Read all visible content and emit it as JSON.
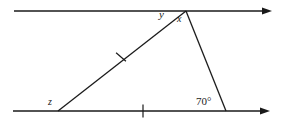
{
  "figure": {
    "type": "geometry-diagram",
    "background_color": "#ffffff",
    "stroke_color": "#1a1a1a",
    "canvas": {
      "width": 283,
      "height": 127
    }
  },
  "labels": {
    "angle_y": "y",
    "angle_x": "x",
    "angle_z": "z",
    "angle_known": "70°"
  },
  "geometry": {
    "parallel_line_top": {
      "x1": 14,
      "y1": 11,
      "x2": 272,
      "y2": 11,
      "arrow": "right"
    },
    "parallel_line_bottom": {
      "x1": 13,
      "y1": 111,
      "x2": 270,
      "y2": 111,
      "arrow": "right"
    },
    "apex": {
      "x": 186,
      "y": 11
    },
    "vertex_z": {
      "x": 58,
      "y": 111
    },
    "vertex_right": {
      "x": 226,
      "y": 111
    },
    "tick_on_slant": {
      "x": 121,
      "y": 57,
      "marks": 1
    },
    "tick_on_base": {
      "x": 143,
      "y": 111,
      "marks": 1
    }
  }
}
